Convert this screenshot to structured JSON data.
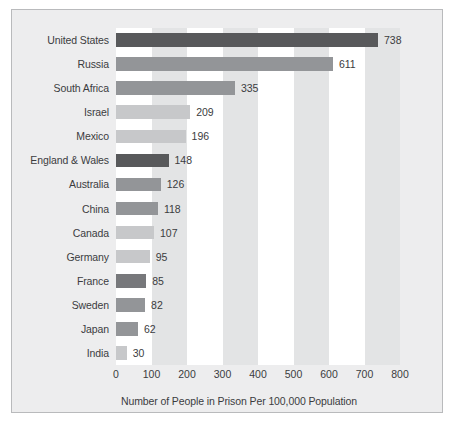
{
  "chart_data": {
    "type": "bar",
    "orientation": "horizontal",
    "title": "",
    "xlabel": "Number of People in Prison Per 100,000 Population",
    "ylabel": "",
    "xlim": [
      0,
      800
    ],
    "xticks": [
      0,
      100,
      200,
      300,
      400,
      500,
      600,
      700,
      800
    ],
    "grid": false,
    "banding": "alternating vertical bands every 100 units",
    "legend": "none",
    "categories": [
      "United States",
      "Russia",
      "South Africa",
      "Israel",
      "Mexico",
      "England & Wales",
      "Australia",
      "China",
      "Canada",
      "Germany",
      "France",
      "Sweden",
      "Japan",
      "India"
    ],
    "values": [
      738,
      611,
      335,
      209,
      196,
      148,
      126,
      118,
      107,
      95,
      85,
      82,
      62,
      30
    ],
    "value_labels": [
      "738",
      "611",
      "335",
      "209",
      "196",
      "148",
      "126",
      "118",
      "107",
      "95",
      "85",
      "82",
      "62",
      "30"
    ],
    "bar_colors": [
      "#58595b",
      "#939598",
      "#939598",
      "#c7c8ca",
      "#c7c8ca",
      "#58595b",
      "#939598",
      "#939598",
      "#c7c8ca",
      "#c7c8ca",
      "#77787b",
      "#939598",
      "#939598",
      "#c7c8ca"
    ]
  },
  "style": {
    "panel_bg": "#ededee",
    "panel_border": "#b9babc",
    "band_light": "#ffffff",
    "band_shade": "#e3e4e5",
    "text_color": "#3b3c3e",
    "page_bg": "#ffffff"
  }
}
